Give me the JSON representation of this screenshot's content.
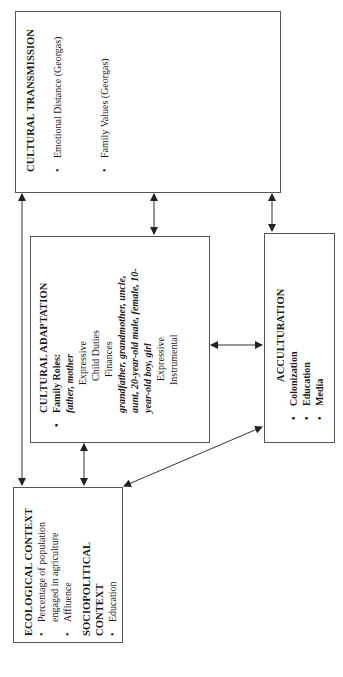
{
  "diagram": {
    "orientation": "rotated-90-ccw",
    "nodes": {
      "cultural_transmission": {
        "title": "CULTURAL TRANSMISSION",
        "items": [
          "Emotional Distance (Georgas)",
          "Family Values (Georgas)"
        ]
      },
      "cultural_adaptation": {
        "title": "CULTURAL ADAPTATION",
        "bullet_label": "Family Roles:",
        "group1_roles": "father, mother",
        "group1_functions": [
          "Expressive",
          "Child Duties",
          "Finances"
        ],
        "group2_roles_line1": "grandfather, grandmother, uncle,",
        "group2_roles_line2": "aunt, 20-year-old male, female, 10-",
        "group2_roles_line3": "year-old boy, girl",
        "group2_functions": [
          "Expressive",
          "Instrumental"
        ]
      },
      "acculturation": {
        "title": "ACCULTURATION",
        "items": [
          "Colonization",
          "Education",
          "Media"
        ]
      },
      "ecological_context": {
        "title": "ECOLOGICAL CONTEXT",
        "items_line1": "Percentage of population",
        "items_line2": "engaged in agriculture",
        "item2": "Affluence",
        "sociopolitical_title_line1": "SOCIOPOLITICAL",
        "sociopolitical_title_line2": "CONTEXT",
        "sociopolitical_items": [
          "Education"
        ]
      }
    },
    "edges": [
      {
        "from": "ecological_context",
        "to": "cultural_transmission",
        "type": "bidirectional"
      },
      {
        "from": "ecological_context",
        "to": "cultural_adaptation",
        "type": "bidirectional"
      },
      {
        "from": "ecological_context",
        "to": "acculturation",
        "type": "bidirectional"
      },
      {
        "from": "cultural_adaptation",
        "to": "cultural_transmission",
        "type": "bidirectional"
      },
      {
        "from": "acculturation",
        "to": "cultural_transmission",
        "type": "bidirectional"
      },
      {
        "from": "cultural_adaptation",
        "to": "acculturation",
        "type": "bidirectional"
      }
    ],
    "bullet_glyph": "•",
    "colors": {
      "line": "#333333",
      "border": "#555555",
      "text": "#1a1a1a"
    }
  }
}
